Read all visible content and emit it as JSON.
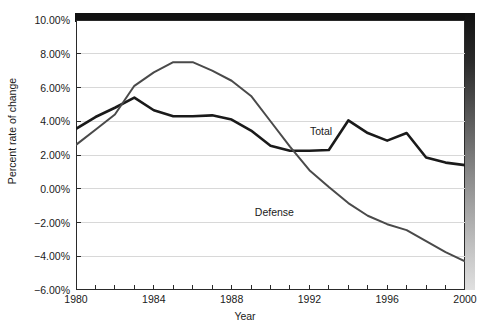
{
  "chart_data": {
    "type": "line",
    "title": "",
    "xlabel": "Year",
    "ylabel": "Percent rate of change",
    "xlim": [
      1980,
      2000
    ],
    "ylim": [
      -6.0,
      10.0
    ],
    "ytick_step": 2.0,
    "grid": true,
    "grid_axis": "y",
    "legend_position": "inline-annotation",
    "x": [
      1980,
      1981,
      1982,
      1983,
      1984,
      1985,
      1986,
      1987,
      1988,
      1989,
      1990,
      1991,
      1992,
      1993,
      1994,
      1995,
      1996,
      1997,
      1998,
      1999,
      2000
    ],
    "xtick_labels": [
      "1980",
      "1984",
      "1988",
      "1992",
      "1996",
      "2000"
    ],
    "xtick_label_values": [
      1980,
      1984,
      1988,
      1992,
      1996,
      2000
    ],
    "ytick_labels": [
      "10.00%",
      "8.00%",
      "6.00%",
      "4.00%",
      "2.00%",
      "0.00%",
      "-2.00%",
      "-4.00%",
      "-6.00%"
    ],
    "ytick_values": [
      10.0,
      8.0,
      6.0,
      4.0,
      2.0,
      0.0,
      -2.0,
      -4.0,
      -6.0
    ],
    "series": [
      {
        "name": "Total",
        "color": "#1a1a1a",
        "label_x": 1992.6,
        "label_y": 3.45,
        "values": [
          3.55,
          4.25,
          4.75,
          5.4,
          4.65,
          4.3,
          4.3,
          4.35,
          4.1,
          3.5,
          2.5,
          2.25,
          2.3,
          2.3,
          2.3,
          2.3,
          3.0,
          4.05,
          3.3,
          2.8,
          3.1
        ]
      },
      {
        "name": "Defense",
        "color": "#4a4a4a",
        "label_x": 1990.2,
        "label_y": -1.35,
        "values": [
          2.6,
          3.5,
          4.4,
          6.1,
          6.9,
          7.5,
          7.5,
          7.05,
          6.4,
          5.5,
          4.0,
          2.5,
          1.1,
          0.1,
          -0.85,
          -1.6,
          -2.1,
          -2.45,
          -3.1,
          -3.75,
          -4.3
        ]
      }
    ],
    "series_overrides": {
      "Total": {
        "note": "values re-read from pixels",
        "values": [
          3.55,
          4.25,
          4.75,
          5.4,
          4.65,
          4.3,
          4.3,
          4.35,
          4.1,
          3.5,
          2.5,
          2.25,
          2.3,
          2.3,
          4.05,
          3.3,
          2.9,
          3.3,
          1.9,
          1.55,
          1.4,
          1.1
        ]
      }
    }
  },
  "series_points": {
    "total": [
      {
        "year": 1980,
        "value": 3.55
      },
      {
        "year": 1981,
        "value": 4.25
      },
      {
        "year": 1982,
        "value": 4.8
      },
      {
        "year": 1983,
        "value": 5.4
      },
      {
        "year": 1984,
        "value": 4.65
      },
      {
        "year": 1985,
        "value": 4.3
      },
      {
        "year": 1986,
        "value": 4.3
      },
      {
        "year": 1987,
        "value": 4.35
      },
      {
        "year": 1988,
        "value": 4.1
      },
      {
        "year": 1989,
        "value": 3.45
      },
      {
        "year": 1990,
        "value": 2.55
      },
      {
        "year": 1991,
        "value": 2.25
      },
      {
        "year": 1992,
        "value": 2.25
      },
      {
        "year": 1993,
        "value": 2.3
      },
      {
        "year": 1994,
        "value": 4.05
      },
      {
        "year": 1995,
        "value": 3.3
      },
      {
        "year": 1996,
        "value": 2.85
      },
      {
        "year": 1997,
        "value": 3.3
      },
      {
        "year": 1998,
        "value": 1.85
      },
      {
        "year": 1999,
        "value": 1.55
      },
      {
        "year": 2000,
        "value": 1.4
      }
    ],
    "defense": [
      {
        "year": 1980,
        "value": 2.6
      },
      {
        "year": 1981,
        "value": 3.5
      },
      {
        "year": 1982,
        "value": 4.4
      },
      {
        "year": 1983,
        "value": 6.1
      },
      {
        "year": 1984,
        "value": 6.9
      },
      {
        "year": 1985,
        "value": 7.5
      },
      {
        "year": 1986,
        "value": 7.5
      },
      {
        "year": 1987,
        "value": 7.0
      },
      {
        "year": 1988,
        "value": 6.4
      },
      {
        "year": 1989,
        "value": 5.5
      },
      {
        "year": 1990,
        "value": 4.0
      },
      {
        "year": 1991,
        "value": 2.5
      },
      {
        "year": 1992,
        "value": 1.1
      },
      {
        "year": 1993,
        "value": 0.1
      },
      {
        "year": 1994,
        "value": -0.85
      },
      {
        "year": 1995,
        "value": -1.6
      },
      {
        "year": 1996,
        "value": -2.1
      },
      {
        "year": 1997,
        "value": -2.45
      },
      {
        "year": 1998,
        "value": -3.1
      },
      {
        "year": 1999,
        "value": -3.75
      },
      {
        "year": 2000,
        "value": -4.3
      }
    ]
  },
  "axes": {
    "y_title": "Percent rate of change",
    "x_title": "Year"
  },
  "annotations": {
    "total_label": "Total",
    "defense_label": "Defense"
  }
}
